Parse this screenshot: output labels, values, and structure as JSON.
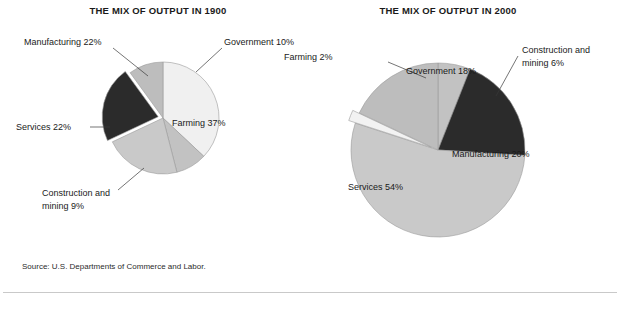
{
  "figure": {
    "source_note": "Source: U.S. Departments of Commerce and Labor.",
    "background_color": "#ffffff",
    "text_color": "#1a1a1a"
  },
  "palette": {
    "dark": "#2b2b2b",
    "medium_gray": "#b0b0b0",
    "light_gray": "#c9c9c9",
    "very_light": "#e8e8e8",
    "near_white": "#f2f2f2",
    "outline": "#9a9a9a"
  },
  "chart_data": [
    {
      "type": "pie",
      "id": "mix-1900",
      "title": "THE MIX OF OUTPUT IN 1900",
      "categories": [
        "Farming",
        "Construction and mining",
        "Services",
        "Manufacturing",
        "Government"
      ],
      "values": [
        37,
        9,
        22,
        22,
        10
      ],
      "labels": [
        "Farming 37%",
        "Construction and mining 9%",
        "Services 22%",
        "Manufacturing 22%",
        "Government 10%"
      ],
      "colors": [
        "#f0f0f0",
        "#c2c2c2",
        "#c9c9c9",
        "#2b2b2b",
        "#bdbdbd"
      ],
      "exploded": [
        "Manufacturing"
      ],
      "units": "percent",
      "total": 100,
      "start_angle_deg": 0,
      "direction": "clockwise"
    },
    {
      "type": "pie",
      "id": "mix-2000",
      "title": "THE MIX OF OUTPUT IN 2000",
      "categories": [
        "Construction and mining",
        "Manufacturing",
        "Services",
        "Farming",
        "Government"
      ],
      "values": [
        6,
        20,
        54,
        2,
        18
      ],
      "labels": [
        "Construction and mining 6%",
        "Manufacturing 20%",
        "Services 54%",
        "Farming 2%",
        "Government 18%"
      ],
      "colors": [
        "#c2c2c2",
        "#2b2b2b",
        "#c9c9c9",
        "#f2f2f2",
        "#bdbdbd"
      ],
      "exploded": [
        "Farming"
      ],
      "units": "percent",
      "total": 100,
      "start_angle_deg": 0,
      "direction": "clockwise"
    }
  ],
  "chart_1900": {
    "title": "THE MIX OF OUTPUT IN 1900",
    "inner_labels": {
      "farming": "Farming 37%"
    },
    "callouts": {
      "government": "Government 10%",
      "manufacturing": "Manufacturing 22%",
      "services": "Services 22%",
      "construction_line1": "Construction and",
      "construction_line2": "mining 9%"
    }
  },
  "chart_2000": {
    "title": "THE MIX OF OUTPUT IN 2000",
    "inner_labels": {
      "government": "Government 18%",
      "manufacturing": "Manufacturing 20%",
      "services": "Services 54%"
    },
    "callouts": {
      "farming": "Farming 2%",
      "construction_line1": "Construction and",
      "construction_line2": "mining 6%"
    }
  }
}
